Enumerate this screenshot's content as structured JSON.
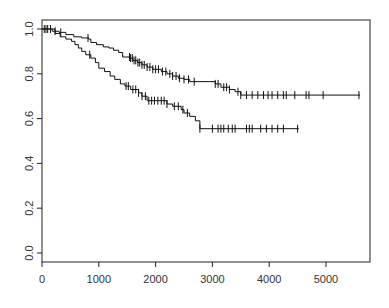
{
  "chart_data": {
    "type": "line",
    "subtype": "kaplan-meier step curve",
    "title": "",
    "xlabel": "",
    "ylabel": "",
    "xlim": [
      0,
      5700
    ],
    "ylim": [
      -0.04,
      1.03
    ],
    "x_ticks": [
      0,
      1000,
      2000,
      3000,
      4000,
      5000
    ],
    "y_ticks": [
      0.0,
      0.2,
      0.4,
      0.6,
      0.8,
      1.0
    ],
    "x_tick_labels": [
      "0",
      "1000",
      "2000",
      "3000",
      "4000",
      "5000"
    ],
    "y_tick_labels": [
      "0.0",
      "0.2",
      "0.4",
      "0.6",
      "0.8",
      "1.0"
    ],
    "grid": false,
    "legend": null,
    "series": [
      {
        "name": "upper curve",
        "steps": [
          [
            0,
            1.0
          ],
          [
            120,
            1.0
          ],
          [
            180,
            0.99
          ],
          [
            300,
            0.985
          ],
          [
            420,
            0.975
          ],
          [
            560,
            0.965
          ],
          [
            700,
            0.96
          ],
          [
            820,
            0.955
          ],
          [
            860,
            0.94
          ],
          [
            960,
            0.93
          ],
          [
            1080,
            0.92
          ],
          [
            1180,
            0.915
          ],
          [
            1260,
            0.905
          ],
          [
            1350,
            0.895
          ],
          [
            1420,
            0.875
          ],
          [
            1550,
            0.87
          ],
          [
            1600,
            0.86
          ],
          [
            1680,
            0.85
          ],
          [
            1760,
            0.84
          ],
          [
            1850,
            0.83
          ],
          [
            1950,
            0.82
          ],
          [
            2100,
            0.81
          ],
          [
            2200,
            0.8
          ],
          [
            2300,
            0.79
          ],
          [
            2400,
            0.78
          ],
          [
            2500,
            0.775
          ],
          [
            2600,
            0.765
          ],
          [
            3050,
            0.755
          ],
          [
            3150,
            0.74
          ],
          [
            3300,
            0.73
          ],
          [
            3400,
            0.72
          ],
          [
            3500,
            0.705
          ],
          [
            5600,
            0.705
          ]
        ],
        "censor_times": [
          40,
          70,
          100,
          150,
          230,
          330,
          810,
          1540,
          1560,
          1590,
          1620,
          1650,
          1690,
          1720,
          1760,
          1800,
          1850,
          1900,
          1950,
          2000,
          2050,
          2120,
          2180,
          2250,
          2300,
          2360,
          2420,
          2500,
          2580,
          2680,
          3050,
          3100,
          3200,
          3250,
          3300,
          3450,
          3500,
          3600,
          3700,
          3800,
          3900,
          3980,
          4050,
          4150,
          4250,
          4300,
          4450,
          4650,
          4700,
          4950,
          5580
        ]
      },
      {
        "name": "lower curve",
        "steps": [
          [
            0,
            1.0
          ],
          [
            170,
            1.0
          ],
          [
            230,
            0.98
          ],
          [
            320,
            0.965
          ],
          [
            420,
            0.955
          ],
          [
            520,
            0.945
          ],
          [
            580,
            0.93
          ],
          [
            640,
            0.915
          ],
          [
            700,
            0.9
          ],
          [
            770,
            0.885
          ],
          [
            860,
            0.87
          ],
          [
            940,
            0.85
          ],
          [
            1000,
            0.825
          ],
          [
            1100,
            0.81
          ],
          [
            1200,
            0.79
          ],
          [
            1280,
            0.775
          ],
          [
            1380,
            0.755
          ],
          [
            1460,
            0.745
          ],
          [
            1560,
            0.73
          ],
          [
            1700,
            0.715
          ],
          [
            1760,
            0.7
          ],
          [
            1850,
            0.68
          ],
          [
            2200,
            0.665
          ],
          [
            2300,
            0.655
          ],
          [
            2450,
            0.64
          ],
          [
            2500,
            0.625
          ],
          [
            2600,
            0.61
          ],
          [
            2700,
            0.59
          ],
          [
            2780,
            0.555
          ],
          [
            4520,
            0.555
          ]
        ],
        "censor_times": [
          840,
          1480,
          1520,
          1600,
          1650,
          1700,
          1760,
          1820,
          1880,
          1930,
          1980,
          2040,
          2100,
          2150,
          2200,
          2330,
          2400,
          2480,
          2560,
          2780,
          3000,
          3100,
          3150,
          3200,
          3280,
          3350,
          3400,
          3600,
          3650,
          3700,
          3850,
          3950,
          4050,
          4150,
          4250,
          4500
        ]
      }
    ]
  }
}
